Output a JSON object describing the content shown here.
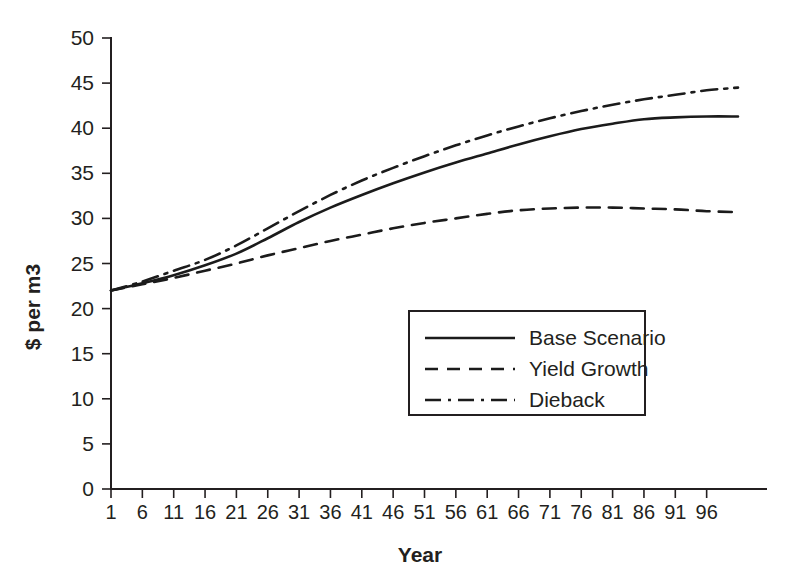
{
  "chart_data": {
    "type": "line",
    "title": "",
    "xlabel": "Year",
    "ylabel": "$ per m3",
    "xlim": [
      1,
      101
    ],
    "ylim": [
      0,
      50
    ],
    "ytick_step": 5,
    "xtick_step": 5,
    "grid": false,
    "legend_position": "center-right-inside",
    "xticks": [
      "1",
      "6",
      "11",
      "16",
      "21",
      "26",
      "31",
      "36",
      "41",
      "46",
      "51",
      "56",
      "61",
      "66",
      "71",
      "76",
      "81",
      "86",
      "91",
      "96"
    ],
    "yticks": [
      "0",
      "5",
      "10",
      "15",
      "20",
      "25",
      "30",
      "35",
      "40",
      "45",
      "50"
    ],
    "x": [
      1,
      6,
      11,
      16,
      21,
      26,
      31,
      36,
      41,
      46,
      51,
      56,
      61,
      66,
      71,
      76,
      81,
      86,
      91,
      96,
      101
    ],
    "series": [
      {
        "name": "Base Scenario",
        "style": "solid",
        "values": [
          22.0,
          22.8,
          23.7,
          24.8,
          26.1,
          27.8,
          29.6,
          31.2,
          32.6,
          33.9,
          35.1,
          36.2,
          37.2,
          38.2,
          39.1,
          39.9,
          40.5,
          41.0,
          41.2,
          41.3,
          41.3
        ]
      },
      {
        "name": "Yield Growth",
        "style": "dashed",
        "values": [
          22.0,
          22.7,
          23.4,
          24.2,
          25.0,
          25.9,
          26.7,
          27.5,
          28.2,
          28.9,
          29.5,
          30.0,
          30.5,
          30.9,
          31.1,
          31.2,
          31.2,
          31.1,
          31.0,
          30.8,
          30.7
        ]
      },
      {
        "name": "Dieback",
        "style": "dash-dot",
        "values": [
          22.0,
          23.0,
          24.2,
          25.4,
          27.0,
          28.9,
          30.8,
          32.6,
          34.2,
          35.6,
          36.9,
          38.1,
          39.2,
          40.2,
          41.1,
          41.9,
          42.6,
          43.2,
          43.7,
          44.2,
          44.5
        ]
      }
    ],
    "colors": {
      "line": "#1b1b1b",
      "axis": "#231f20",
      "background": "#ffffff"
    }
  },
  "legend": {
    "items": [
      {
        "label": "Base Scenario",
        "style": "solid"
      },
      {
        "label": "Yield Growth",
        "style": "dashed"
      },
      {
        "label": "Dieback",
        "style": "dash-dot"
      }
    ]
  }
}
